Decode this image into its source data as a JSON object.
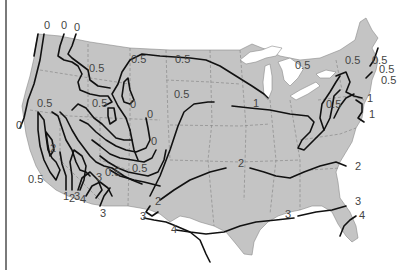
{
  "map": {
    "subject": "Contiguous United States isoline map",
    "colors": {
      "land": "#c4c4c4",
      "water": "#ffffff",
      "isoline": "#111111",
      "label": "#444444",
      "state_border": "#7f7f7f"
    },
    "labels": [
      {
        "text": "0",
        "x": 44,
        "y": 29
      },
      {
        "text": "0",
        "x": 61,
        "y": 29
      },
      {
        "text": "0",
        "x": 74,
        "y": 31
      },
      {
        "text": "0.5",
        "x": 89,
        "y": 72
      },
      {
        "text": "0.5",
        "x": 37,
        "y": 107
      },
      {
        "text": "0.5",
        "x": 92,
        "y": 107
      },
      {
        "text": "0",
        "x": 16,
        "y": 129
      },
      {
        "text": "2",
        "x": 50,
        "y": 152
      },
      {
        "text": "0.5",
        "x": 28,
        "y": 183
      },
      {
        "text": "1",
        "x": 63,
        "y": 200
      },
      {
        "text": "2",
        "x": 69,
        "y": 202
      },
      {
        "text": "3",
        "x": 74,
        "y": 200
      },
      {
        "text": "4",
        "x": 80,
        "y": 203
      },
      {
        "text": "3",
        "x": 96,
        "y": 181
      },
      {
        "text": "0.5",
        "x": 105,
        "y": 176
      },
      {
        "text": "0.5",
        "x": 132,
        "y": 172
      },
      {
        "text": "0",
        "x": 151,
        "y": 145
      },
      {
        "text": "0.5",
        "x": 174,
        "y": 98
      },
      {
        "text": "0",
        "x": 130,
        "y": 108
      },
      {
        "text": "0",
        "x": 147,
        "y": 118
      },
      {
        "text": "0.5",
        "x": 131,
        "y": 63
      },
      {
        "text": "3",
        "x": 100,
        "y": 217
      },
      {
        "text": "0.5",
        "x": 175,
        "y": 63
      },
      {
        "text": "1",
        "x": 253,
        "y": 107
      },
      {
        "text": "0.5",
        "x": 295,
        "y": 69
      },
      {
        "text": "0.5",
        "x": 345,
        "y": 64
      },
      {
        "text": "0.5",
        "x": 372,
        "y": 64
      },
      {
        "text": "0.5",
        "x": 379,
        "y": 73
      },
      {
        "text": "1",
        "x": 367,
        "y": 102
      },
      {
        "text": "1",
        "x": 369,
        "y": 118
      },
      {
        "text": "0.5",
        "x": 326,
        "y": 108
      },
      {
        "text": "0.5",
        "x": 381,
        "y": 84
      },
      {
        "text": "2",
        "x": 238,
        "y": 167
      },
      {
        "text": "2",
        "x": 155,
        "y": 205
      },
      {
        "text": "2",
        "x": 355,
        "y": 170
      },
      {
        "text": "3",
        "x": 140,
        "y": 220
      },
      {
        "text": "4",
        "x": 171,
        "y": 233
      },
      {
        "text": "3",
        "x": 285,
        "y": 218
      },
      {
        "text": "3",
        "x": 355,
        "y": 205
      },
      {
        "text": "4",
        "x": 359,
        "y": 219
      }
    ]
  }
}
